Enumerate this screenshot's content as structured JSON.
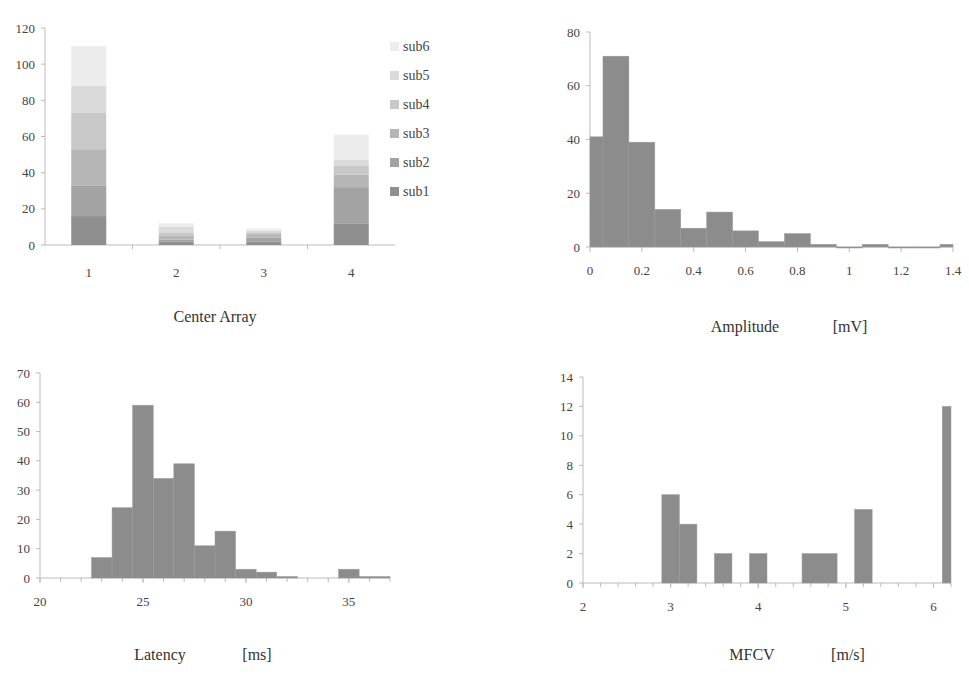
{
  "figure": {
    "panels": [
      "center_array",
      "amplitude",
      "latency",
      "mfcv"
    ]
  },
  "center_array": {
    "xlabel": "Center Array",
    "legend": [
      "sub6",
      "sub5",
      "sub4",
      "sub3",
      "sub2",
      "sub1"
    ]
  },
  "amplitude": {
    "xlabel_name": "Amplitude",
    "xlabel_unit": "[mV]"
  },
  "latency": {
    "xlabel_name": "Latency",
    "xlabel_unit": "[ms]"
  },
  "mfcv": {
    "xlabel_name": "MFCV",
    "xlabel_unit": "[m/s]"
  },
  "colors": {
    "bar": "#8c8c8c",
    "axis": "#bbbbbb",
    "sub1": "#8f8f8f",
    "sub2": "#a3a3a3",
    "sub3": "#b6b6b6",
    "sub4": "#c8c8c8",
    "sub5": "#dadada",
    "sub6": "#ececec"
  },
  "chart_data": [
    {
      "id": "center_array",
      "type": "bar",
      "stacked": true,
      "title": "",
      "xlabel": "Center Array",
      "ylabel": "",
      "categories": [
        "1",
        "2",
        "3",
        "4"
      ],
      "ylim": [
        0,
        120
      ],
      "yticks": [
        0,
        20,
        40,
        60,
        80,
        100,
        120
      ],
      "legend_position": "right",
      "grid": false,
      "series": [
        {
          "name": "sub1",
          "values": [
            16,
            2,
            2,
            12
          ]
        },
        {
          "name": "sub2",
          "values": [
            17,
            1,
            2,
            20
          ]
        },
        {
          "name": "sub3",
          "values": [
            20,
            2,
            2,
            7
          ]
        },
        {
          "name": "sub4",
          "values": [
            20,
            2,
            1,
            5
          ]
        },
        {
          "name": "sub5",
          "values": [
            15,
            3,
            1,
            3
          ]
        },
        {
          "name": "sub6",
          "values": [
            22,
            2,
            1,
            14
          ]
        }
      ]
    },
    {
      "id": "amplitude",
      "type": "bar",
      "histogram": true,
      "title": "",
      "xlabel": "Amplitude [mV]",
      "ylabel": "",
      "xlim": [
        0,
        1.4
      ],
      "xticks": [
        0,
        0.2,
        0.4,
        0.6,
        0.8,
        1,
        1.2,
        1.4
      ],
      "ylim": [
        0,
        80
      ],
      "yticks": [
        0,
        20,
        40,
        60,
        80
      ],
      "bins": [
        {
          "x0": 0.0,
          "x1": 0.05,
          "count": 41
        },
        {
          "x0": 0.05,
          "x1": 0.15,
          "count": 71
        },
        {
          "x0": 0.15,
          "x1": 0.25,
          "count": 39
        },
        {
          "x0": 0.25,
          "x1": 0.35,
          "count": 14
        },
        {
          "x0": 0.35,
          "x1": 0.45,
          "count": 7
        },
        {
          "x0": 0.45,
          "x1": 0.55,
          "count": 13
        },
        {
          "x0": 0.55,
          "x1": 0.65,
          "count": 6
        },
        {
          "x0": 0.65,
          "x1": 0.75,
          "count": 2
        },
        {
          "x0": 0.75,
          "x1": 0.85,
          "count": 5
        },
        {
          "x0": 0.85,
          "x1": 0.95,
          "count": 1
        },
        {
          "x0": 0.95,
          "x1": 1.05,
          "count": 0
        },
        {
          "x0": 1.05,
          "x1": 1.15,
          "count": 1
        },
        {
          "x0": 1.15,
          "x1": 1.25,
          "count": 0
        },
        {
          "x0": 1.25,
          "x1": 1.35,
          "count": 0
        },
        {
          "x0": 1.35,
          "x1": 1.4,
          "count": 1
        }
      ]
    },
    {
      "id": "latency",
      "type": "bar",
      "histogram": true,
      "title": "",
      "xlabel": "Latency [ms]",
      "ylabel": "",
      "xlim": [
        20,
        37
      ],
      "xticks": [
        20,
        25,
        30,
        35
      ],
      "ylim": [
        0,
        70
      ],
      "yticks": [
        0,
        10,
        20,
        30,
        40,
        50,
        60,
        70
      ],
      "bins": [
        {
          "x0": 22.5,
          "x1": 23.5,
          "count": 7
        },
        {
          "x0": 23.5,
          "x1": 24.5,
          "count": 24
        },
        {
          "x0": 24.5,
          "x1": 25.5,
          "count": 59
        },
        {
          "x0": 25.5,
          "x1": 26.5,
          "count": 34
        },
        {
          "x0": 26.5,
          "x1": 27.5,
          "count": 39
        },
        {
          "x0": 27.5,
          "x1": 28.5,
          "count": 11
        },
        {
          "x0": 28.5,
          "x1": 29.5,
          "count": 16
        },
        {
          "x0": 29.5,
          "x1": 30.5,
          "count": 3
        },
        {
          "x0": 30.5,
          "x1": 31.5,
          "count": 2
        },
        {
          "x0": 31.5,
          "x1": 32.5,
          "count": 0.5
        },
        {
          "x0": 34.5,
          "x1": 35.5,
          "count": 3
        },
        {
          "x0": 35.5,
          "x1": 37.0,
          "count": 0.5
        }
      ]
    },
    {
      "id": "mfcv",
      "type": "bar",
      "histogram": true,
      "title": "",
      "xlabel": "MFCV [m/s]",
      "ylabel": "",
      "xlim": [
        2,
        6.2
      ],
      "xticks": [
        2,
        3,
        4,
        5,
        6
      ],
      "ylim": [
        0,
        14
      ],
      "yticks": [
        0,
        2,
        4,
        6,
        8,
        10,
        12,
        14
      ],
      "bins": [
        {
          "x0": 2.9,
          "x1": 3.1,
          "count": 6
        },
        {
          "x0": 3.1,
          "x1": 3.3,
          "count": 4
        },
        {
          "x0": 3.5,
          "x1": 3.7,
          "count": 2
        },
        {
          "x0": 3.9,
          "x1": 4.1,
          "count": 2
        },
        {
          "x0": 4.5,
          "x1": 4.9,
          "count": 2
        },
        {
          "x0": 5.1,
          "x1": 5.3,
          "count": 5
        },
        {
          "x0": 6.1,
          "x1": 6.2,
          "count": 12
        }
      ]
    }
  ]
}
